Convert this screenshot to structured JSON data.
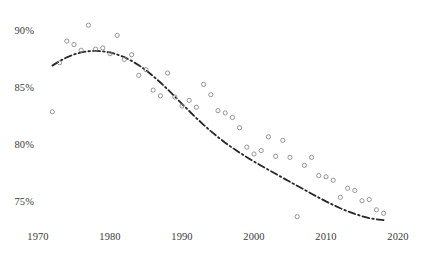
{
  "chart_data": {
    "type": "scatter",
    "title": "",
    "subtitle": "",
    "xlabel": "",
    "ylabel": "",
    "xlim": [
      1968.5,
      2021.5
    ],
    "ylim": [
      73.0,
      91.2
    ],
    "grid": false,
    "legend": null,
    "x_ticks": [
      1970,
      1980,
      1990,
      2000,
      2010,
      2020
    ],
    "x_tick_labels": [
      "1970",
      "1980",
      "1990",
      "2000",
      "2010",
      "2020"
    ],
    "y_ticks": [
      75,
      80,
      85,
      90
    ],
    "y_tick_labels": [
      "75%",
      "80%",
      "85%",
      "90%"
    ],
    "marker": {
      "style": "open-circle",
      "edge_color": "#8a8a8a",
      "fill_color": "none",
      "size_px": 4.2,
      "edge_width": 0.9
    },
    "series": [
      {
        "name": "observations",
        "type": "scatter",
        "points": [
          {
            "x": 1972,
            "y": 83.0
          },
          {
            "x": 1973,
            "y": 87.3
          },
          {
            "x": 1974,
            "y": 89.2
          },
          {
            "x": 1975,
            "y": 88.9
          },
          {
            "x": 1976,
            "y": 88.4
          },
          {
            "x": 1977,
            "y": 90.6
          },
          {
            "x": 1978,
            "y": 88.5
          },
          {
            "x": 1979,
            "y": 88.6
          },
          {
            "x": 1980,
            "y": 88.1
          },
          {
            "x": 1981,
            "y": 89.7
          },
          {
            "x": 1982,
            "y": 87.6
          },
          {
            "x": 1983,
            "y": 88.0
          },
          {
            "x": 1984,
            "y": 86.2
          },
          {
            "x": 1985,
            "y": 86.7
          },
          {
            "x": 1986,
            "y": 84.9
          },
          {
            "x": 1987,
            "y": 84.4
          },
          {
            "x": 1988,
            "y": 86.4
          },
          {
            "x": 1989,
            "y": 84.3
          },
          {
            "x": 1990,
            "y": 83.5
          },
          {
            "x": 1991,
            "y": 84.0
          },
          {
            "x": 1992,
            "y": 83.4
          },
          {
            "x": 1993,
            "y": 85.4
          },
          {
            "x": 1994,
            "y": 84.5
          },
          {
            "x": 1995,
            "y": 83.1
          },
          {
            "x": 1996,
            "y": 82.9
          },
          {
            "x": 1997,
            "y": 82.5
          },
          {
            "x": 1998,
            "y": 81.6
          },
          {
            "x": 1999,
            "y": 79.9
          },
          {
            "x": 2000,
            "y": 79.3
          },
          {
            "x": 2001,
            "y": 79.6
          },
          {
            "x": 2002,
            "y": 80.8
          },
          {
            "x": 2003,
            "y": 79.1
          },
          {
            "x": 2004,
            "y": 80.5
          },
          {
            "x": 2005,
            "y": 79.0
          },
          {
            "x": 2006,
            "y": 73.8
          },
          {
            "x": 2007,
            "y": 78.3
          },
          {
            "x": 2008,
            "y": 79.0
          },
          {
            "x": 2009,
            "y": 77.4
          },
          {
            "x": 2010,
            "y": 77.3
          },
          {
            "x": 2011,
            "y": 77.0
          },
          {
            "x": 2012,
            "y": 75.5
          },
          {
            "x": 2013,
            "y": 76.3
          },
          {
            "x": 2014,
            "y": 76.1
          },
          {
            "x": 2015,
            "y": 75.2
          },
          {
            "x": 2016,
            "y": 75.3
          },
          {
            "x": 2017,
            "y": 74.4
          },
          {
            "x": 2018,
            "y": 74.1
          }
        ]
      },
      {
        "name": "fitted-trend",
        "type": "line",
        "line_style": "dash-dot",
        "color": "#262626",
        "width_px": 1.8,
        "points": [
          {
            "x": 1972,
            "y": 87.05
          },
          {
            "x": 1973,
            "y": 87.45
          },
          {
            "x": 1974,
            "y": 87.78
          },
          {
            "x": 1975,
            "y": 88.03
          },
          {
            "x": 1976,
            "y": 88.21
          },
          {
            "x": 1977,
            "y": 88.31
          },
          {
            "x": 1978,
            "y": 88.35
          },
          {
            "x": 1979,
            "y": 88.31
          },
          {
            "x": 1980,
            "y": 88.21
          },
          {
            "x": 1981,
            "y": 88.03
          },
          {
            "x": 1982,
            "y": 87.79
          },
          {
            "x": 1983,
            "y": 87.47
          },
          {
            "x": 1984,
            "y": 87.09
          },
          {
            "x": 1985,
            "y": 86.64
          },
          {
            "x": 1986,
            "y": 86.13
          },
          {
            "x": 1987,
            "y": 85.57
          },
          {
            "x": 1988,
            "y": 84.97
          },
          {
            "x": 1989,
            "y": 84.34
          },
          {
            "x": 1990,
            "y": 83.7
          },
          {
            "x": 1991,
            "y": 83.07
          },
          {
            "x": 1992,
            "y": 82.45
          },
          {
            "x": 1993,
            "y": 81.86
          },
          {
            "x": 1994,
            "y": 81.3
          },
          {
            "x": 1995,
            "y": 80.78
          },
          {
            "x": 1996,
            "y": 80.29
          },
          {
            "x": 1997,
            "y": 79.84
          },
          {
            "x": 1998,
            "y": 79.42
          },
          {
            "x": 1999,
            "y": 79.02
          },
          {
            "x": 2000,
            "y": 78.64
          },
          {
            "x": 2001,
            "y": 78.27
          },
          {
            "x": 2002,
            "y": 77.91
          },
          {
            "x": 2003,
            "y": 77.56
          },
          {
            "x": 2004,
            "y": 77.21
          },
          {
            "x": 2005,
            "y": 76.86
          },
          {
            "x": 2006,
            "y": 76.51
          },
          {
            "x": 2007,
            "y": 76.16
          },
          {
            "x": 2008,
            "y": 75.81
          },
          {
            "x": 2009,
            "y": 75.47
          },
          {
            "x": 2010,
            "y": 75.14
          },
          {
            "x": 2011,
            "y": 74.83
          },
          {
            "x": 2012,
            "y": 74.54
          },
          {
            "x": 2013,
            "y": 74.27
          },
          {
            "x": 2014,
            "y": 74.04
          },
          {
            "x": 2015,
            "y": 73.84
          },
          {
            "x": 2016,
            "y": 73.68
          },
          {
            "x": 2017,
            "y": 73.57
          },
          {
            "x": 2018,
            "y": 73.5
          }
        ]
      }
    ]
  },
  "colors": {
    "background": "#ffffff",
    "marker_edge": "#8a8a8a",
    "trend_line": "#262626",
    "tick_text": "#3a3a3a"
  }
}
